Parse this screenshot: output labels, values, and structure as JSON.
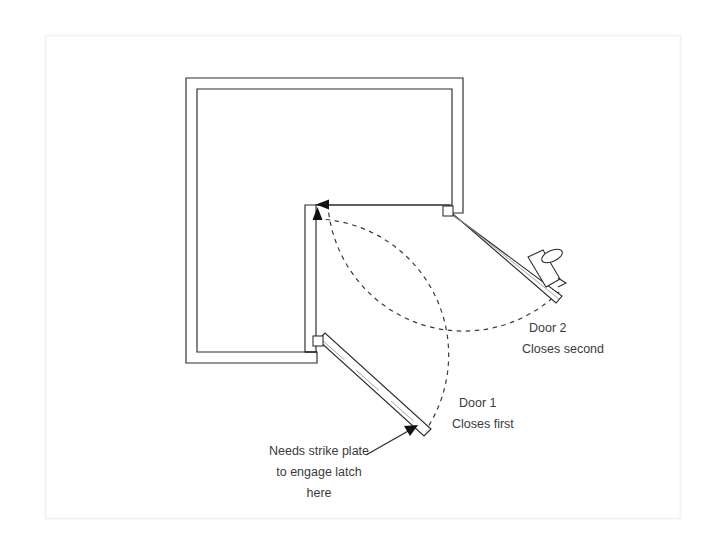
{
  "document": {
    "title": "Corner Double Door Swing Diagram",
    "type": "architectural-floor-plan-detail",
    "background_color": "#ffffff",
    "canvas_border_color": "#f2f2f2",
    "line_color": "#222222",
    "text_color": "#3b3b3b",
    "swing_arc_color": "#333333"
  },
  "annotations": {
    "door1": {
      "name_label": "Door 1",
      "order_label": "Closes first",
      "x": 459,
      "y": 407
    },
    "door2": {
      "name_label": "Door 2",
      "order_label": "Closes second",
      "x": 523,
      "y": 332
    },
    "strike_plate": {
      "line1": "Needs strike plate",
      "line2": "to engage latch",
      "line3": "here",
      "x": 319,
      "y": 450
    }
  },
  "geometry": {
    "canvas_border": {
      "x": 45,
      "y": 35,
      "width": 635,
      "height": 483
    },
    "wall_thickness": 11,
    "wall_outer_path": "M 186 78 L 463 78 L 463 212 L 448 212 L 448 205 L 305 205 L 305 352 L 317 352 L 317 363 L 186 363 Z",
    "walls": [
      {
        "name": "top-wall",
        "x1": 186,
        "y1": 78,
        "x2": 463,
        "y2": 78
      },
      {
        "name": "right-wall",
        "x1": 463,
        "y1": 78,
        "x2": 463,
        "y2": 212
      },
      {
        "name": "notch-top-wall",
        "x1": 305,
        "y1": 205,
        "x2": 452,
        "y2": 205
      },
      {
        "name": "notch-vertical-wall",
        "x1": 305,
        "y1": 205,
        "x2": 305,
        "y2": 352
      },
      {
        "name": "bottom-wall",
        "x1": 186,
        "y1": 363,
        "x2": 317,
        "y2": 363
      },
      {
        "name": "left-wall",
        "x1": 186,
        "y1": 78,
        "x2": 186,
        "y2": 363
      }
    ],
    "door1": {
      "hinge": {
        "x": 320,
        "y": 346
      },
      "free_end": {
        "x": 424,
        "y": 433
      },
      "leaf_thickness": 9,
      "swing_arc": "M 424 433 A 136 136 0 0 0 318 210",
      "arrow_tip": {
        "x": 318,
        "y": 206
      },
      "arrow_direction": "up"
    },
    "door2": {
      "hinge": {
        "x": 449,
        "y": 213
      },
      "free_end": {
        "x": 559,
        "y": 292
      },
      "leaf_thickness": 9,
      "swing_arc": "M 559 292 A 136 136 0 0 1 324 205",
      "arrow_tip": {
        "x": 318,
        "y": 205
      },
      "arrow_direction": "left",
      "knob": {
        "x": 547,
        "y": 265,
        "label": "door-knob"
      }
    },
    "strike_leader": {
      "x1": 369,
      "y1": 452,
      "x2": 414,
      "y2": 428
    }
  }
}
